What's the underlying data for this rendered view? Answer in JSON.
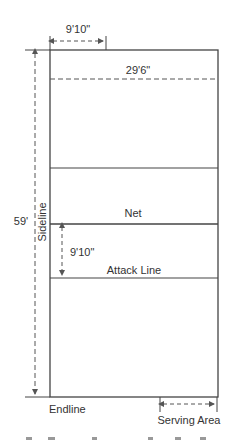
{
  "diagram": {
    "type": "volleyball-court",
    "colors": {
      "line": "#444444",
      "dashed": "#555555",
      "text": "#333333"
    },
    "labels": {
      "top_width": "9'10\"",
      "court_width": "29'6\"",
      "length": "59'",
      "sideline": "Sideline",
      "net": "Net",
      "attack_distance": "9'10\"",
      "attack_line": "Attack Line",
      "endline": "Endline",
      "serving_area": "Serving Area"
    }
  }
}
